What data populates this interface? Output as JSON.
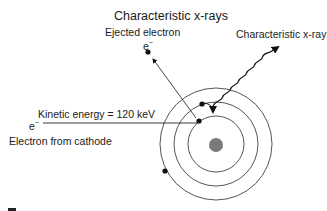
{
  "diagram": {
    "title": "Characteristic x-rays",
    "labels": {
      "ejected_electron": "Ejected electron",
      "characteristic_xray": "Characteristic x-ray",
      "kinetic_energy": "Kinetic energy = 120 keV",
      "electron_from_cathode": "Electron from cathode",
      "electron_symbol": "e",
      "electron_charge": "−"
    },
    "atom": {
      "center": [
        216,
        144
      ],
      "shell_radii": [
        28,
        42,
        56
      ],
      "nucleus_radius": 7,
      "nucleus_color": "#7a7a7a",
      "line_color": "#555555"
    },
    "electrons": [
      {
        "shell": "middle",
        "pos": [
          202,
          104
        ]
      },
      {
        "shell": "inner",
        "pos": [
          199,
          121
        ]
      },
      {
        "shell": "outer",
        "pos": [
          165,
          171
        ]
      }
    ]
  }
}
